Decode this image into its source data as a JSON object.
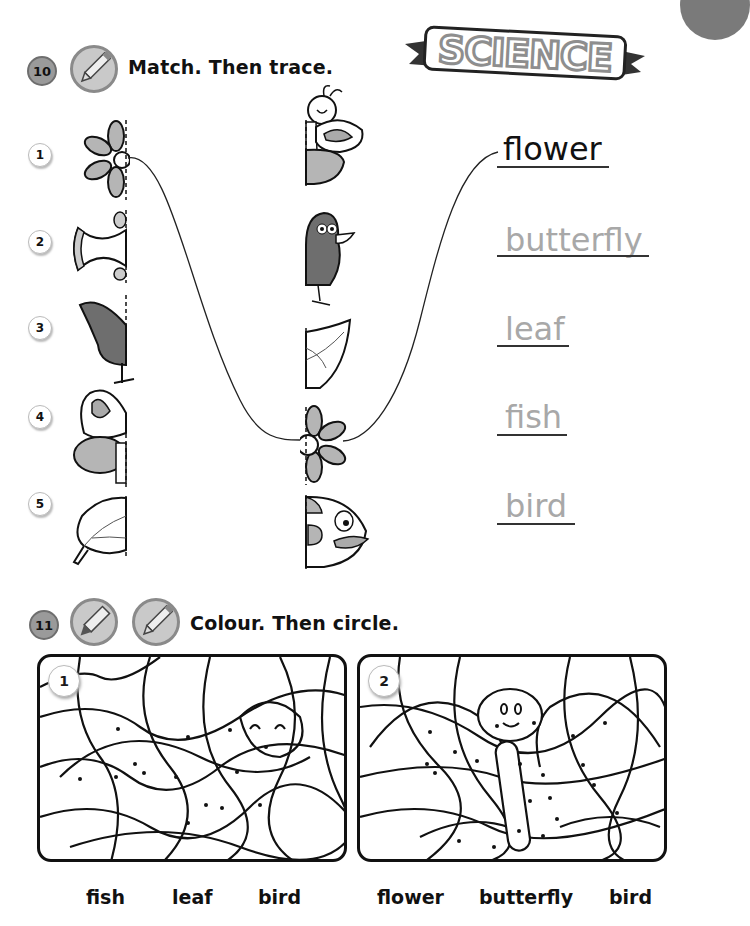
{
  "header": {
    "subject_banner": "SCIENCE"
  },
  "exercise10": {
    "number": "10",
    "icon": "pencil-icon",
    "instruction": "Match. Then trace.",
    "rows": [
      {
        "number": "1",
        "left_half": "flower",
        "right_half": "butterfly"
      },
      {
        "number": "2",
        "left_half": "fish",
        "right_half": "bird"
      },
      {
        "number": "3",
        "left_half": "bird",
        "right_half": "leaf"
      },
      {
        "number": "4",
        "left_half": "butterfly",
        "right_half": "flower"
      },
      {
        "number": "5",
        "left_half": "leaf",
        "right_half": "fish"
      }
    ],
    "words": [
      {
        "text": "flower",
        "traced": true
      },
      {
        "text": "butterfly",
        "traced": false
      },
      {
        "text": "leaf",
        "traced": false
      },
      {
        "text": "fish",
        "traced": false
      },
      {
        "text": "bird",
        "traced": false
      }
    ],
    "example_match": {
      "left": "1 flower",
      "right": "4 flower",
      "word": "flower"
    }
  },
  "exercise11": {
    "number": "11",
    "icons": [
      "crayon-icon",
      "pencil-icon"
    ],
    "instruction": "Colour. Then circle.",
    "panels": [
      {
        "number": "1",
        "hidden_picture": "fish",
        "options": [
          "fish",
          "leaf",
          "bird"
        ]
      },
      {
        "number": "2",
        "hidden_picture": "butterfly",
        "options": [
          "flower",
          "butterfly",
          "bird"
        ]
      }
    ]
  },
  "colors": {
    "ink": "#111111",
    "trace_grey": "#a8a8a8",
    "badge_grey": "#9a9a9a",
    "fill_grey": "#b5b5b5",
    "dark_fill": "#6e6e6e"
  }
}
